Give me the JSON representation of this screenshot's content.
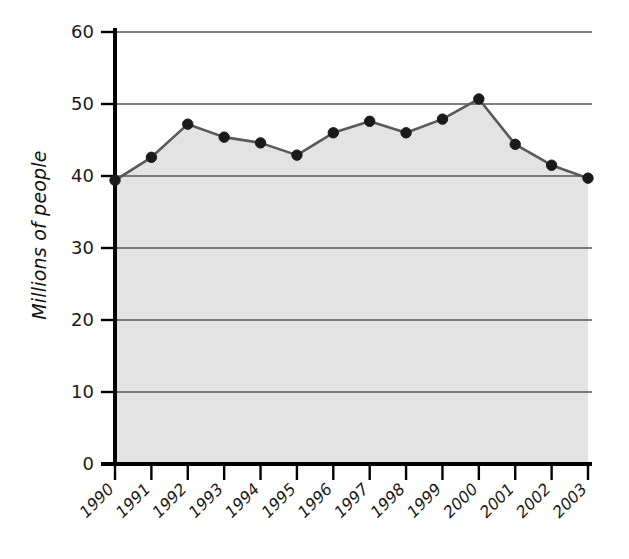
{
  "chart_data": {
    "type": "area",
    "title": "",
    "subtitle": "",
    "xlabel": "",
    "ylabel": "Millions of people",
    "categories": [
      "1990",
      "1991",
      "1992",
      "1993",
      "1994",
      "1995",
      "1996",
      "1997",
      "1998",
      "1999",
      "2000",
      "2001",
      "2002",
      "2003"
    ],
    "values": [
      39.4,
      42.6,
      47.2,
      45.4,
      44.6,
      42.9,
      46.0,
      47.6,
      46.0,
      47.9,
      50.7,
      44.4,
      41.5,
      39.7
    ],
    "series": [
      {
        "name": "Millions of people",
        "values": [
          39.4,
          42.6,
          47.2,
          45.4,
          44.6,
          42.9,
          46.0,
          47.6,
          46.0,
          47.9,
          50.7,
          44.4,
          41.5,
          39.7
        ]
      }
    ],
    "ylim": [
      0,
      60
    ],
    "yticks": [
      0,
      10,
      20,
      30,
      40,
      50,
      60
    ],
    "ytick_labels": [
      "0",
      "10",
      "20",
      "30",
      "40",
      "50",
      "60"
    ],
    "xtick_labels": [
      "1990",
      "1991",
      "1992",
      "1993",
      "1994",
      "1995",
      "1996",
      "1997",
      "1998",
      "1999",
      "2000",
      "2001",
      "2002",
      "2003"
    ],
    "xtick_rotation": 45,
    "grid": true,
    "grid_axis": "y",
    "legend": false,
    "legend_position": "none",
    "annotations": [],
    "colors": {
      "area_fill": "#e3e3e3",
      "line": "#595959",
      "marker": "#1a1a1a",
      "gridline": "#555555",
      "axis": "#000000",
      "background": "#ffffff",
      "text": "#1a1a1a"
    }
  }
}
